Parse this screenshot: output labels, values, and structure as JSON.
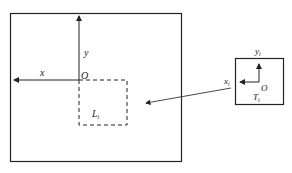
{
  "diagram": {
    "main_frame": {
      "x_label": "x",
      "y_label": "y",
      "origin_label": "O",
      "region_label": "L",
      "region_subscript": "i"
    },
    "tile_frame": {
      "x_label": "x",
      "x_subscript": "i",
      "y_label": "y",
      "y_subscript": "i",
      "origin_label": "O",
      "tile_label": "T",
      "tile_subscript": "i"
    },
    "colors": {
      "stroke": "#222222",
      "background": "#ffffff"
    }
  }
}
